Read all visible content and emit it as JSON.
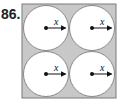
{
  "problem": {
    "number": "86."
  },
  "figure": {
    "square": {
      "x": 22,
      "y": 4,
      "size": 94,
      "fill": "#c8c8c8",
      "stroke": "#7a7a7a"
    },
    "circles": [
      {
        "cx": 46,
        "cy": 28,
        "r": 22.5,
        "label": "x"
      },
      {
        "cx": 92,
        "cy": 28,
        "r": 22.5,
        "label": "x"
      },
      {
        "cx": 46,
        "cy": 74,
        "r": 22.5,
        "label": "x"
      },
      {
        "cx": 92,
        "cy": 74,
        "r": 22.5,
        "label": "x"
      }
    ],
    "circle_fill": "#ffffff",
    "circle_stroke": "#8a8a8a"
  }
}
